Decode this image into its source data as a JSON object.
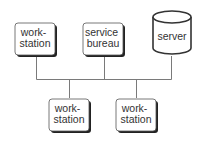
{
  "diagram": {
    "type": "network-topology",
    "colors": {
      "stroke": "#444444",
      "shadow": "#222222",
      "fill": "#ffffff",
      "line": "#777777",
      "text": "#333333"
    },
    "nodes": [
      {
        "id": "workstation-top-left",
        "shape": "rounded-box",
        "lines": [
          "work-",
          "station"
        ]
      },
      {
        "id": "service-bureau",
        "shape": "rounded-box",
        "lines": [
          "service",
          "bureau"
        ]
      },
      {
        "id": "server",
        "shape": "cylinder",
        "lines": [
          "server"
        ]
      },
      {
        "id": "workstation-bottom-left",
        "shape": "rounded-box",
        "lines": [
          "work-",
          "station"
        ]
      },
      {
        "id": "workstation-bottom-right",
        "shape": "rounded-box",
        "lines": [
          "work-",
          "station"
        ]
      }
    ],
    "bus": {
      "label": "",
      "connects": [
        "workstation-top-left",
        "service-bureau",
        "server",
        "workstation-bottom-left",
        "workstation-bottom-right"
      ]
    }
  }
}
